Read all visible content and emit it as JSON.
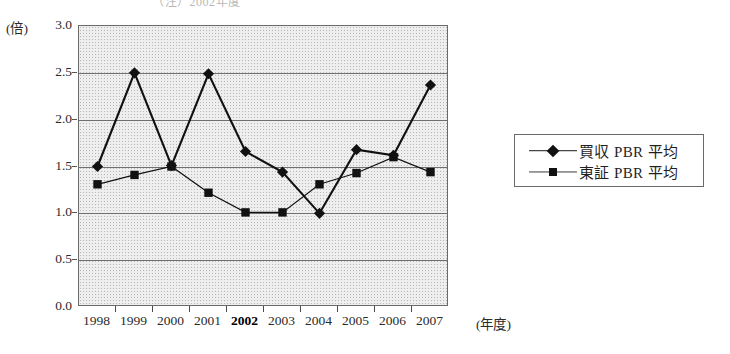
{
  "top_note": "（注）2002年度",
  "axes": {
    "y_unit": "(倍)",
    "x_unit": "(年度)",
    "y_ticks": [
      "0.0",
      "0.5",
      "1.0",
      "1.5",
      "2.0",
      "2.5",
      "3.0"
    ]
  },
  "legend": {
    "items": [
      {
        "label": "買収 PBR 平均",
        "marker": "diamond",
        "color": "#111111"
      },
      {
        "label": "東証 PBR 平均",
        "marker": "square",
        "color": "#111111"
      }
    ]
  },
  "chart_data": {
    "type": "line",
    "title": "",
    "xlabel": "(年度)",
    "ylabel": "(倍)",
    "ylim": [
      0.0,
      3.0
    ],
    "y_ticks": [
      0.0,
      0.5,
      1.0,
      1.5,
      2.0,
      2.5,
      3.0
    ],
    "grid": true,
    "legend_position": "right",
    "categories": [
      "1998",
      "1999",
      "2000",
      "2001",
      "2002",
      "2003",
      "2004",
      "2005",
      "2006",
      "2007"
    ],
    "emphasized_category": "2002",
    "series": [
      {
        "name": "買収 PBR 平均",
        "marker": "diamond",
        "color": "#111111",
        "values": [
          1.5,
          2.5,
          1.51,
          2.49,
          1.66,
          1.44,
          1.0,
          1.68,
          1.62,
          2.37
        ]
      },
      {
        "name": "東証 PBR 平均",
        "marker": "square",
        "color": "#111111",
        "values": [
          1.31,
          1.41,
          1.5,
          1.22,
          1.01,
          1.01,
          1.31,
          1.43,
          1.6,
          1.44
        ]
      }
    ]
  }
}
